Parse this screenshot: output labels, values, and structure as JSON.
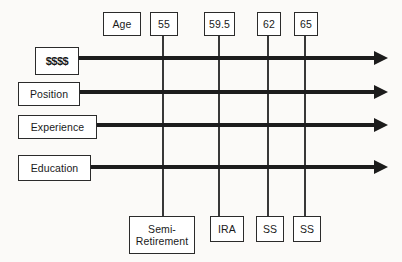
{
  "diagram": {
    "colors": {
      "background": "#fbfaf8",
      "box_fill": "#ffffff",
      "box_border": "#2b2b2b",
      "arrow": "#1c1c1c",
      "vertical_line": "#383838"
    },
    "axis_header": {
      "label": "Age",
      "x": 103,
      "y": 12,
      "w": 38,
      "h": 24
    },
    "age_markers": [
      {
        "label": "55",
        "x": 150,
        "y": 12,
        "w": 28,
        "h": 24,
        "line_x": 163
      },
      {
        "label": "59.5",
        "x": 204,
        "y": 12,
        "w": 31,
        "h": 24,
        "line_x": 219
      },
      {
        "label": "62",
        "x": 257,
        "y": 12,
        "w": 24,
        "h": 24,
        "line_x": 268
      },
      {
        "label": "65",
        "x": 294,
        "y": 12,
        "w": 24,
        "h": 24,
        "line_x": 305
      }
    ],
    "rows": [
      {
        "label": "$$$$",
        "x": 35,
        "y": 47,
        "w": 44,
        "h": 28,
        "line_y": 58,
        "money": true
      },
      {
        "label": "Position",
        "x": 18,
        "y": 82,
        "w": 62,
        "h": 24,
        "line_y": 92,
        "money": false
      },
      {
        "label": "Experience",
        "x": 18,
        "y": 115,
        "w": 79,
        "h": 24,
        "line_y": 125,
        "money": false
      },
      {
        "label": "Education",
        "x": 18,
        "y": 155,
        "w": 73,
        "h": 26,
        "line_y": 167,
        "money": false
      }
    ],
    "arrow_end_x": 388,
    "vertical_line_top": 36,
    "vertical_line_bottom": 216,
    "events": [
      {
        "label": "Semi-\nRetirement",
        "x": 129,
        "y": 216,
        "w": 66,
        "h": 38
      },
      {
        "label": "IRA",
        "x": 210,
        "y": 216,
        "w": 34,
        "h": 26
      },
      {
        "label": "SS",
        "x": 256,
        "y": 216,
        "w": 28,
        "h": 26
      },
      {
        "label": "SS",
        "x": 293,
        "y": 216,
        "w": 28,
        "h": 26
      }
    ]
  }
}
